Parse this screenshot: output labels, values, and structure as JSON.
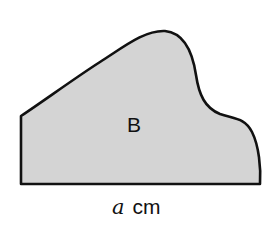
{
  "figure": {
    "region_label": "B",
    "dimension": {
      "variable": "a",
      "unit": "cm"
    },
    "colors": {
      "fill": "#d4d4d4",
      "stroke": "#111111",
      "background": "#ffffff"
    }
  }
}
